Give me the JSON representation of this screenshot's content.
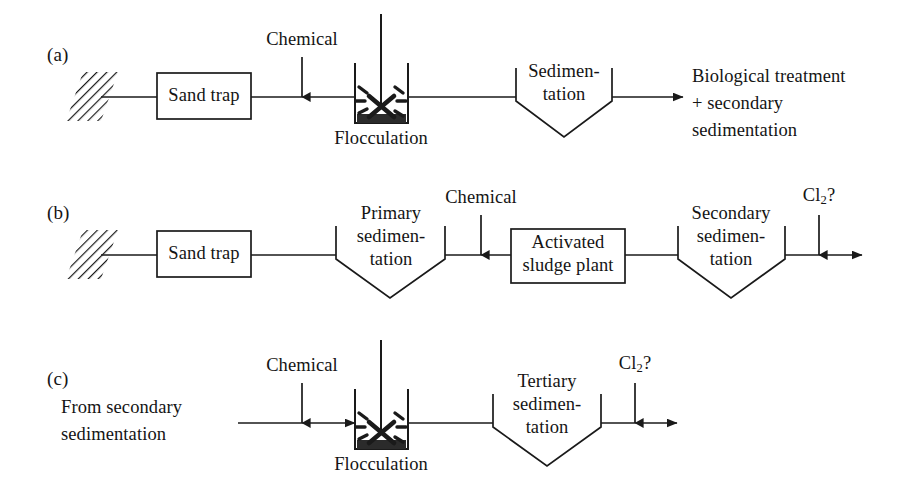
{
  "figure": {
    "stroke_color": "#1a1a1a",
    "fill_color": "#ffffff",
    "sludge_color": "#2b2b2b",
    "background": "#ffffff"
  },
  "rows": [
    {
      "tag": "(a)",
      "inlet": {
        "type": "hatched-source"
      },
      "units": [
        {
          "name": "sand-trap",
          "shape": "rect",
          "label": "Sand trap"
        },
        {
          "name": "flocculation",
          "shape": "tank",
          "label": "Flocculation",
          "dosing": "Chemical"
        },
        {
          "name": "sedimentation",
          "shape": "hopper",
          "label": "Sedimen-\ntation"
        }
      ],
      "outlet": {
        "label": "Biological treatment\n+ secondary\nsedimentation"
      }
    },
    {
      "tag": "(b)",
      "inlet": {
        "type": "hatched-source"
      },
      "units": [
        {
          "name": "sand-trap",
          "shape": "rect",
          "label": "Sand trap"
        },
        {
          "name": "primary-sedimentation",
          "shape": "hopper",
          "label": "Primary\nsedimen-\ntation"
        },
        {
          "name": "activated-sludge-plant",
          "shape": "rect",
          "label": "Activated\nsludge plant",
          "dosing": "Chemical"
        },
        {
          "name": "secondary-sedimentation",
          "shape": "hopper",
          "label": "Secondary\nsedimen-\ntation"
        }
      ],
      "outlet": {
        "dosing": "Cl₂?"
      }
    },
    {
      "tag": "(c)",
      "inlet": {
        "type": "text-source",
        "label": "From secondary\nsedimentation"
      },
      "units": [
        {
          "name": "flocculation",
          "shape": "tank",
          "label": "Flocculation",
          "dosing": "Chemical"
        },
        {
          "name": "tertiary-sedimentation",
          "shape": "hopper",
          "label": "Tertiary\nsedimen-\ntation"
        }
      ],
      "outlet": {
        "dosing": "Cl₂?"
      }
    }
  ],
  "labels": {
    "row_a_tag": "(a)",
    "row_b_tag": "(b)",
    "row_c_tag": "(c)",
    "a_chemical": "Chemical",
    "a_sand_trap": "Sand trap",
    "a_flocculation": "Flocculation",
    "a_sed_l1": "Sedimen-",
    "a_sed_l2": "tation",
    "a_out_l1": "Biological treatment",
    "a_out_l2": "+ secondary",
    "a_out_l3": "sedimentation",
    "b_sand_trap": "Sand trap",
    "b_prim_l1": "Primary",
    "b_prim_l2": "sedimen-",
    "b_prim_l3": "tation",
    "b_chemical": "Chemical",
    "b_asp_l1": "Activated",
    "b_asp_l2": "sludge plant",
    "b_sec_l1": "Secondary",
    "b_sec_l2": "sedimen-",
    "b_sec_l3": "tation",
    "b_cl2": "Cl",
    "b_cl2_sub": "2",
    "b_cl2_q": "?",
    "c_chemical": "Chemical",
    "c_from_l1": "From secondary",
    "c_from_l2": "sedimentation",
    "c_flocculation": "Flocculation",
    "c_tert_l1": "Tertiary",
    "c_tert_l2": "sedimen-",
    "c_tert_l3": "tation",
    "c_cl2": "Cl",
    "c_cl2_sub": "2",
    "c_cl2_q": "?"
  }
}
